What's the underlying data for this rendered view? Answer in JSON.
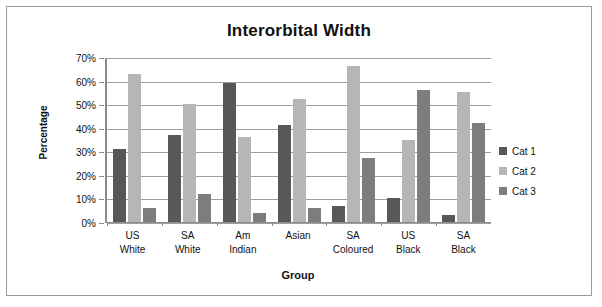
{
  "chart_data": {
    "type": "bar",
    "title": "Interorbital Width",
    "xlabel": "Group",
    "ylabel": "Percentage",
    "categories": [
      "US\nWhite",
      "SA\nWhite",
      "Am\nIndian",
      "Asian",
      "SA\nColoured",
      "US\nBlack",
      "SA\nBlack"
    ],
    "category_lines": [
      [
        "US",
        "White"
      ],
      [
        "SA",
        "White"
      ],
      [
        "Am",
        "Indian"
      ],
      [
        "Asian",
        ""
      ],
      [
        "SA",
        "Coloured"
      ],
      [
        "US",
        "Black"
      ],
      [
        "SA",
        "Black"
      ]
    ],
    "series": [
      {
        "name": "Cat 1",
        "color": "#585858",
        "values": [
          31,
          37,
          59,
          41,
          7,
          10,
          3
        ]
      },
      {
        "name": "Cat 2",
        "color": "#b6b6b6",
        "values": [
          63,
          50,
          36,
          52,
          66,
          35,
          55
        ]
      },
      {
        "name": "Cat 3",
        "color": "#7d7d7d",
        "values": [
          6,
          12,
          4,
          6,
          27,
          56,
          42
        ]
      }
    ],
    "ylim": [
      0,
      70
    ],
    "ytick_values": [
      70,
      60,
      50,
      40,
      30,
      20,
      10,
      0
    ],
    "ytick_labels": [
      "70%",
      "60%",
      "50%",
      "40%",
      "30%",
      "20%",
      "10%",
      "0%"
    ],
    "grid": true,
    "legend_position": "right",
    "legend_entries": [
      "Cat 1",
      "Cat 2",
      "Cat 3"
    ]
  }
}
